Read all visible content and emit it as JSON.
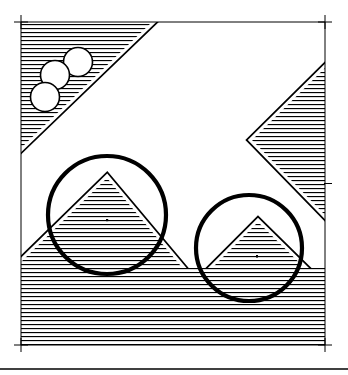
{
  "artwork": {
    "title": "Hatched Geometric Composition",
    "medium": "line-drawing",
    "background_color": "#ffffff",
    "ink_color": "#000000",
    "canvas": {
      "width": 348,
      "height": 375
    },
    "hatching": {
      "orientation": "horizontal",
      "period_px": 4,
      "line_weight_px": 1.1,
      "color": "#000000"
    },
    "frame": {
      "label": "registration frame",
      "left": 21,
      "top": 22,
      "right": 325,
      "bottom": 345,
      "stroke_width": 1,
      "crosshair_arm_px": 7,
      "corner_marks": [
        "top-left",
        "top-right",
        "bottom-left",
        "bottom-right"
      ],
      "edge_ticks": [
        "right-middle"
      ]
    },
    "baseline_rule": {
      "y": 369,
      "x1": 0,
      "x2": 348,
      "stroke_width": 1.6
    },
    "shapes": [
      {
        "id": "top-left-wedge",
        "name": "hatched corner triangle",
        "type": "polygon",
        "fill": "hatch",
        "outline": "white-keyline",
        "points": "21,22 152,22 21,148"
      },
      {
        "id": "right-chevron",
        "name": "hatched chevron arrow",
        "type": "polygon",
        "fill": "hatch",
        "outline": "white-keyline",
        "points": "325,68 252,140 325,215 325,68"
      },
      {
        "id": "ground-massif",
        "name": "hatched landscape with peak and valley",
        "type": "polygon",
        "fill": "hatch",
        "outline": "white-keyline",
        "points": "21,345 21,262 107,178 196,284 258,222 325,288 325,345"
      },
      {
        "id": "lower-plain",
        "name": "hatched lower plain",
        "type": "polygon",
        "fill": "hatch",
        "points": "21,268 325,268 325,345 21,345"
      }
    ],
    "circles": {
      "small": [
        {
          "id": "pebble-top",
          "name": "small white circle upper",
          "cx": 78,
          "cy": 62,
          "r": 14.5,
          "fill": "#ffffff",
          "stroke_width": 1.6
        },
        {
          "id": "pebble-middle",
          "name": "small white circle middle",
          "cx": 55,
          "cy": 75,
          "r": 14.5,
          "fill": "#ffffff",
          "stroke_width": 1.6
        },
        {
          "id": "pebble-bottom",
          "name": "small white circle lower",
          "cx": 45,
          "cy": 97,
          "r": 14.5,
          "fill": "#ffffff",
          "stroke_width": 1.6
        }
      ],
      "large": [
        {
          "id": "ring-left",
          "name": "large circle outline left",
          "cx": 107,
          "cy": 215,
          "r": 59,
          "fill": "none",
          "stroke_width": 4.2
        },
        {
          "id": "ring-right",
          "name": "large circle outline right",
          "cx": 249,
          "cy": 248,
          "r": 53,
          "fill": "none",
          "stroke_width": 4.2
        }
      ]
    },
    "marks": [
      {
        "id": "speck-left",
        "name": "ink speck in left peak",
        "x": 106,
        "y": 219,
        "w": 2.2,
        "h": 2.2
      },
      {
        "id": "speck-right",
        "name": "ink speck in right slope",
        "x": 256,
        "y": 255,
        "w": 2.0,
        "h": 2.6
      }
    ]
  }
}
